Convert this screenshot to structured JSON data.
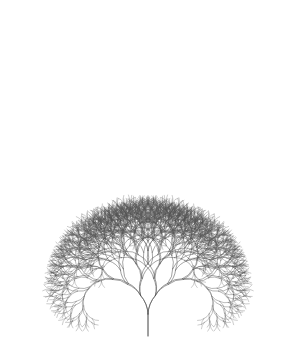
{
  "image": {
    "subject": "generative branching tree line drawing",
    "background_color": "#ffffff",
    "line_color": "#555555",
    "symmetry": "bilateral"
  }
}
